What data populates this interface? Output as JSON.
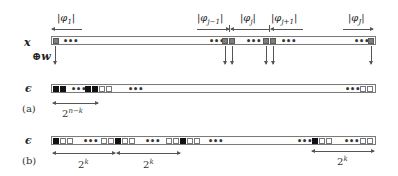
{
  "diagram": {
    "row_x": {
      "label": "x"
    },
    "xor_label": "⊕w",
    "row_eps_a": {
      "label": "ϵ"
    },
    "row_eps_b": {
      "label": "ϵ"
    },
    "panel_a": {
      "label": "(a)",
      "span_label": "2",
      "span_sup": "n−k"
    },
    "panel_b": {
      "label": "(b)",
      "span_label": "2",
      "span_sup": "k"
    },
    "segments": [
      {
        "name": "phi_1",
        "label": "|φ",
        "sub": "1",
        "close": "|",
        "arrow": "left"
      },
      {
        "name": "phi_j-1",
        "label": "|φ",
        "sub": "j−1",
        "close": "|",
        "arrow": "right"
      },
      {
        "name": "phi_j",
        "label": "|φ",
        "sub": "j",
        "close": "|",
        "arrow": "left"
      },
      {
        "name": "phi_j+1",
        "label": "|φ",
        "sub": "j+1",
        "close": "|",
        "arrow": "left"
      },
      {
        "name": "phi_J",
        "label": "|φ",
        "sub": "J",
        "close": "|",
        "arrow": "right"
      }
    ],
    "dots": "•••",
    "colors": {
      "gray_cell": "#7e7e7e",
      "black_cell": "#111111",
      "white_cell": "#ffffff",
      "border": "#7a7a7a"
    }
  }
}
